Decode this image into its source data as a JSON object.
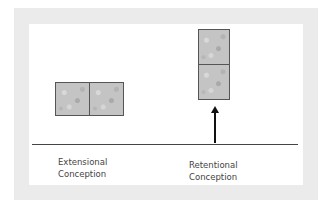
{
  "diagram": {
    "frame_color": "#ebebeb",
    "panel_color": "#ffffff",
    "tile_color": "#c4c4c4",
    "line_color": "#444444",
    "extensional": {
      "tile_count": 2,
      "orientation": "horizontal",
      "label_line1": "Extensional",
      "label_line2": "Conception"
    },
    "retentional": {
      "tile_count": 2,
      "orientation": "vertical",
      "arrow": "up-arrow",
      "label_line1": "Retentional",
      "label_line2": "Conception"
    }
  }
}
